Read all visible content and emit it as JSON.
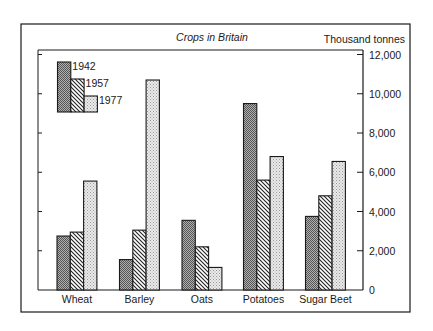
{
  "chart_data": {
    "type": "bar",
    "title": "Crops in Britain",
    "xlabel": "",
    "ylabel": "Thousand tonnes",
    "ylim": [
      0,
      12000
    ],
    "yticks": [
      0,
      2000,
      4000,
      6000,
      8000,
      10000,
      12000
    ],
    "ytick_labels": [
      "0",
      "2,000",
      "4,000",
      "6,000",
      "8,000",
      "10,000",
      "12,000"
    ],
    "y_axis_position": "right",
    "grid": false,
    "legend_position": "top-left (inside plot, stepped)",
    "categories": [
      "Wheat",
      "Barley",
      "Oats",
      "Potatoes",
      "Sugar Beet"
    ],
    "series": [
      {
        "name": "1942",
        "pattern": "dark-checker",
        "values": [
          2750,
          1550,
          3550,
          9500,
          3750
        ]
      },
      {
        "name": "1957",
        "pattern": "diagonal-hatch",
        "values": [
          2950,
          3050,
          2200,
          5600,
          4800
        ]
      },
      {
        "name": "1977",
        "pattern": "light-stipple",
        "values": [
          5550,
          10700,
          1150,
          6800,
          6550
        ]
      }
    ]
  },
  "colors": {
    "ink": "#1a1a1a",
    "dark_fill": "#8a8a8a",
    "light_fill": "#d6d6d6",
    "paper": "#ffffff"
  }
}
